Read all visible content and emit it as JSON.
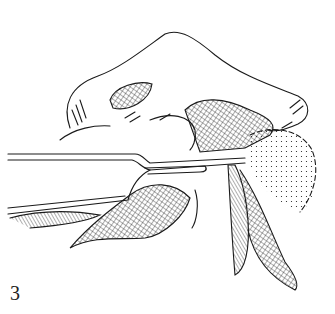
{
  "figure": {
    "label": "3",
    "colors": {
      "ink": "#1a1a1a",
      "background": "#ffffff"
    }
  }
}
